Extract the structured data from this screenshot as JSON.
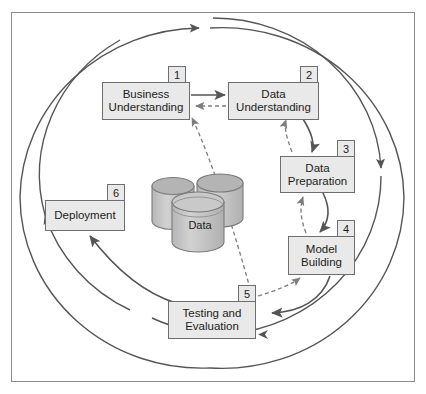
{
  "diagram": {
    "frame_border_color": "#8c8c8c",
    "box_fill_color": "#e9e9e9",
    "box_border_color": "#6e6e6e",
    "arrow_color": "#555555",
    "dashed_arrow_color": "#808080",
    "cylinder_fill_color": "#c8c8c8",
    "cylinder_top_color": "#b4b4b4",
    "phases": [
      {
        "number": "1",
        "label": "Business\nUnderstanding",
        "name": "business-understanding"
      },
      {
        "number": "2",
        "label": "Data\nUnderstanding",
        "name": "data-understanding"
      },
      {
        "number": "3",
        "label": "Data\nPreparation",
        "name": "data-preparation"
      },
      {
        "number": "4",
        "label": "Model\nBuilding",
        "name": "model-building"
      },
      {
        "number": "5",
        "label": "Testing and\nEvaluation",
        "name": "testing-and-evaluation"
      },
      {
        "number": "6",
        "label": "Deployment",
        "name": "deployment"
      }
    ],
    "database": {
      "label": "Data",
      "icon": "database-cylinder-stack-icon"
    },
    "flow_arrows": [
      {
        "from": "1",
        "to": "2",
        "style": "solid"
      },
      {
        "from": "2",
        "to": "3",
        "style": "solid"
      },
      {
        "from": "3",
        "to": "4",
        "style": "solid"
      },
      {
        "from": "4",
        "to": "5",
        "style": "solid"
      },
      {
        "from": "5",
        "to": "6",
        "style": "solid"
      }
    ],
    "feedback_arrows": [
      {
        "from": "2",
        "to": "1",
        "style": "dashed"
      },
      {
        "from": "3",
        "to": "2",
        "style": "dashed"
      },
      {
        "from": "4",
        "to": "3",
        "style": "dashed"
      },
      {
        "from": "5",
        "to": "1",
        "style": "dashed"
      },
      {
        "from": "5",
        "to": "4",
        "style": "dashed"
      }
    ],
    "cycle_rings": [
      {
        "name": "outer-ring",
        "direction": "clockwise-top"
      },
      {
        "name": "inner-ring",
        "direction": "clockwise"
      }
    ]
  }
}
